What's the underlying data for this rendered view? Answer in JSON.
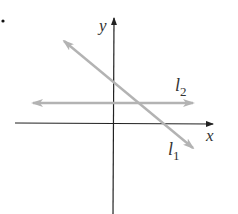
{
  "diagram": {
    "type": "coordinate-plane",
    "axes": {
      "x_label": "x",
      "y_label": "y",
      "color": "#222222"
    },
    "lines": [
      {
        "name": "l1",
        "label_main": "l",
        "label_sub": "1",
        "description": "line with negative slope",
        "color": "#b3b3b3"
      },
      {
        "name": "l2",
        "label_main": "l",
        "label_sub": "2",
        "description": "horizontal line above x-axis",
        "color": "#b3b3b3"
      }
    ],
    "bullet": "•"
  }
}
